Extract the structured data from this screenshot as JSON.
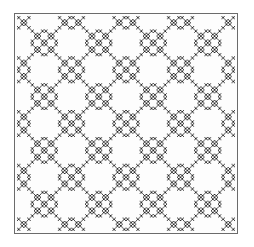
{
  "figure": {
    "caption": "Recursive X (saltire) fractal",
    "fill_color": "#2a2a2a",
    "background_color": "#fdfdfd",
    "frame_color": "#6b6b6b",
    "depth": 3,
    "mask_4x4": [
      [
        1,
        0,
        0,
        1
      ],
      [
        0,
        1,
        1,
        0
      ],
      [
        0,
        1,
        1,
        0
      ],
      [
        1,
        0,
        0,
        1
      ]
    ]
  }
}
